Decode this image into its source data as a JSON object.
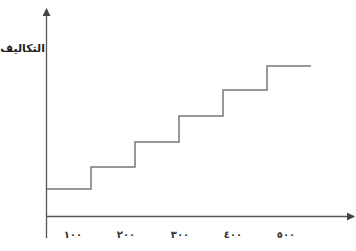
{
  "chart_data": {
    "type": "line",
    "subtype": "step",
    "title": "",
    "xlabel": "",
    "ylabel": "التكاليف",
    "categories": [
      "١٠٠",
      "٢٠٠",
      "٣٠٠",
      "٤٠٠",
      "٥٠٠"
    ],
    "x_numeric": [
      100,
      200,
      300,
      400,
      500
    ],
    "series": [
      {
        "name": "التكاليف",
        "steps": [
          {
            "x_from": 0,
            "x_to": 100,
            "level": 1
          },
          {
            "x_from": 100,
            "x_to": 200,
            "level": 2
          },
          {
            "x_from": 200,
            "x_to": 300,
            "level": 3
          },
          {
            "x_from": 300,
            "x_to": 400,
            "level": 4
          },
          {
            "x_from": 400,
            "x_to": 500,
            "level": 5
          },
          {
            "x_from": 500,
            "x_to": 600,
            "level": 6
          }
        ],
        "values_relative": [
          28,
          50,
          75,
          101,
          127,
          151
        ]
      }
    ],
    "y_ticks": [],
    "grid": false,
    "legend": "none",
    "line_color": "#777777",
    "axis_color": "#555555"
  },
  "axes": {
    "y_label": "التكاليف",
    "x_ticks": [
      "١٠٠",
      "٢٠٠",
      "٣٠٠",
      "٤٠٠",
      "٥٠٠"
    ]
  }
}
